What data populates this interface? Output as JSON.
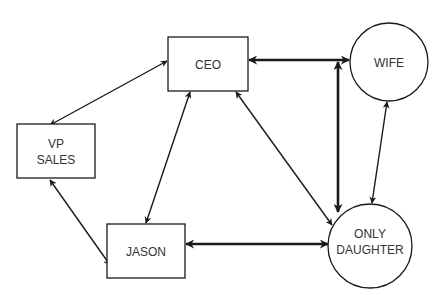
{
  "diagram": {
    "type": "relationship-diagram",
    "colors": {
      "stroke": "#1a1a1a",
      "text": "#333333",
      "background": "#ffffff"
    },
    "nodes": [
      {
        "id": "ceo",
        "shape": "rectangle",
        "lines": [
          "CEO"
        ]
      },
      {
        "id": "wife",
        "shape": "circle",
        "lines": [
          "WIFE"
        ]
      },
      {
        "id": "vp_sales",
        "shape": "rectangle",
        "lines": [
          "VP",
          "SALES"
        ]
      },
      {
        "id": "jason",
        "shape": "rectangle",
        "lines": [
          "JASON"
        ]
      },
      {
        "id": "only_daughter",
        "shape": "circle",
        "lines": [
          "ONLY",
          "DAUGHTER"
        ]
      }
    ],
    "edges": [
      {
        "from": "ceo",
        "to": "vp_sales",
        "direction": "both",
        "weight": "thin"
      },
      {
        "from": "ceo",
        "to": "wife",
        "direction": "both",
        "weight": "thick"
      },
      {
        "from": "ceo",
        "to": "jason",
        "direction": "both",
        "weight": "thin"
      },
      {
        "from": "ceo",
        "to": "only_daughter",
        "direction": "both",
        "weight": "thin"
      },
      {
        "from": "vp_sales",
        "to": "jason",
        "direction": "both",
        "weight": "thin"
      },
      {
        "from": "jason",
        "to": "only_daughter",
        "direction": "both",
        "weight": "thick"
      },
      {
        "from": "wife",
        "to": "only_daughter",
        "direction": "both",
        "weight": "thin"
      },
      {
        "from": "ceo-wife-line",
        "to": "only_daughter",
        "direction": "both",
        "weight": "thick"
      }
    ]
  }
}
